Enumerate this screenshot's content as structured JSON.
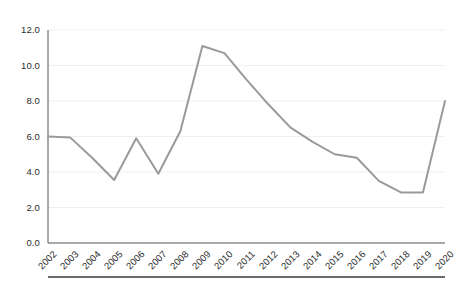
{
  "chart_data": {
    "type": "line",
    "title": "",
    "subtitle": "",
    "xlabel": "",
    "ylabel": "",
    "categories": [
      "2002",
      "2003",
      "2004",
      "2005",
      "2006",
      "2007",
      "2008",
      "2009",
      "2010",
      "2011",
      "2012",
      "2013",
      "2014",
      "2015",
      "2016",
      "2017",
      "2018",
      "2019",
      "2020"
    ],
    "values": [
      6.0,
      5.95,
      4.8,
      3.55,
      5.9,
      3.9,
      6.3,
      11.1,
      10.7,
      9.2,
      7.8,
      6.5,
      5.7,
      5.0,
      4.8,
      3.5,
      2.85,
      2.85,
      8.0
    ],
    "series": [
      {
        "name": "series-1",
        "color": "#9a9a9a",
        "values": [
          6.0,
          5.95,
          4.8,
          3.55,
          5.9,
          3.9,
          6.3,
          11.1,
          10.7,
          9.2,
          7.8,
          6.5,
          5.7,
          5.0,
          4.8,
          3.5,
          2.85,
          2.85,
          8.0
        ]
      }
    ],
    "ylim": [
      0.0,
      12.0
    ],
    "ytick_labels": [
      "0.0",
      "2.0",
      "4.0",
      "6.0",
      "8.0",
      "10.0",
      "12.0"
    ],
    "ytick_values": [
      0.0,
      2.0,
      4.0,
      6.0,
      8.0,
      10.0,
      12.0
    ],
    "grid": true,
    "grid_axis": "y",
    "grid_color": "#f0f0f0",
    "legend": false,
    "legend_position": "none",
    "axis_color": "#555555",
    "line_width": 2,
    "markers": false,
    "annotations": []
  },
  "figure": {
    "background": "#ffffff",
    "footer_rule_color": "#3a3a3a"
  }
}
